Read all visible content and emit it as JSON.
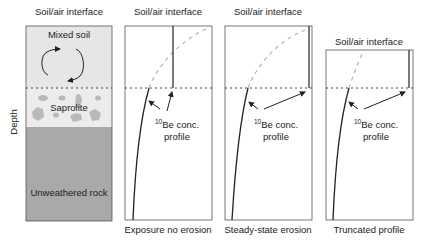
{
  "axis": {
    "ylabel": "Depth"
  },
  "soil_column": {
    "top_label": "Soil/air interface",
    "layers": [
      {
        "name": "Mixed soil",
        "color": "#e6e6e6"
      },
      {
        "name": "Saprolite",
        "color": "#ebebeb"
      },
      {
        "name": "Unweathered rock",
        "color": "#a8a8a8"
      }
    ],
    "blob_color": "#b8b8b8",
    "mixing_arrows": "circular-mixing-arrows"
  },
  "panels": [
    {
      "top_label": "Soil/air interface",
      "caption": "Exposure no erosion",
      "annotation": {
        "sup": "10",
        "line1": "Be conc.",
        "line2": "profile"
      }
    },
    {
      "top_label": "Soil/air interface",
      "caption": "Steady-state erosion",
      "annotation": {
        "sup": "10",
        "line1": "Be conc.",
        "line2": "profile"
      }
    },
    {
      "top_label": "Soil/air interface",
      "caption": "Truncated profile",
      "annotation": {
        "sup": "10",
        "line1": "Be conc.",
        "line2": "profile"
      }
    }
  ],
  "styles": {
    "dashed_profile_color": "#b0b0b0",
    "boundary_line": "dotted",
    "line_color": "#222222"
  }
}
